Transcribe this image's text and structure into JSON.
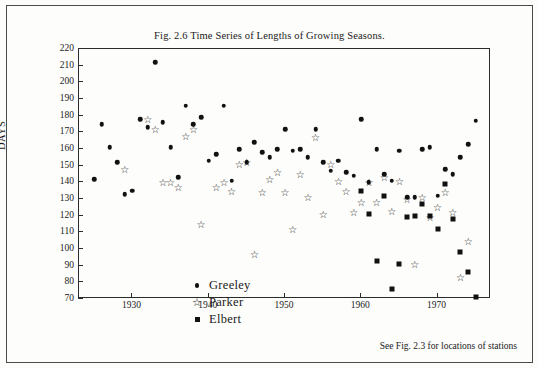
{
  "figure": {
    "title": "Fig. 2.6 Time Series of Lengths of Growing Seasons.",
    "note": "See Fig. 2.3 for locations of stations"
  },
  "chart_data": {
    "type": "scatter",
    "title": "Fig. 2.6 Time Series of Lengths of Growing Seasons.",
    "xlabel": "",
    "ylabel": "DAYS",
    "xlim": [
      1923,
      1977
    ],
    "ylim": [
      70,
      220
    ],
    "grid": false,
    "legend_position": "inside-lower-left",
    "yticks": [
      70,
      80,
      90,
      100,
      110,
      120,
      130,
      140,
      150,
      160,
      170,
      180,
      190,
      200,
      210,
      220
    ],
    "xticks": [
      1930,
      1940,
      1950,
      1960,
      1970
    ],
    "series": [
      {
        "name": "Greeley",
        "marker": "filled-circle",
        "color": "#111111",
        "points": [
          [
            1925,
            142
          ],
          [
            1926,
            175
          ],
          [
            1927,
            161
          ],
          [
            1928,
            152
          ],
          [
            1929,
            133
          ],
          [
            1930,
            135
          ],
          [
            1931,
            178
          ],
          [
            1932,
            173
          ],
          [
            1933,
            212
          ],
          [
            1934,
            176
          ],
          [
            1935,
            161
          ],
          [
            1936,
            143
          ],
          [
            1937,
            186
          ],
          [
            1938,
            175
          ],
          [
            1939,
            179
          ],
          [
            1940,
            153
          ],
          [
            1941,
            157
          ],
          [
            1942,
            186
          ],
          [
            1943,
            141
          ],
          [
            1944,
            160
          ],
          [
            1945,
            152
          ],
          [
            1946,
            164
          ],
          [
            1947,
            158
          ],
          [
            1948,
            155
          ],
          [
            1949,
            160
          ],
          [
            1950,
            172
          ],
          [
            1951,
            159
          ],
          [
            1952,
            160
          ],
          [
            1953,
            155
          ],
          [
            1954,
            172
          ],
          [
            1955,
            152
          ],
          [
            1956,
            147
          ],
          [
            1957,
            153
          ],
          [
            1958,
            146
          ],
          [
            1959,
            144
          ],
          [
            1960,
            178
          ],
          [
            1961,
            140
          ],
          [
            1962,
            160
          ],
          [
            1963,
            145
          ],
          [
            1964,
            141
          ],
          [
            1965,
            159
          ],
          [
            1966,
            131
          ],
          [
            1967,
            131
          ],
          [
            1968,
            160
          ],
          [
            1969,
            161
          ],
          [
            1970,
            132
          ],
          [
            1971,
            148
          ],
          [
            1972,
            145
          ],
          [
            1973,
            155
          ],
          [
            1974,
            163
          ],
          [
            1975,
            177
          ]
        ]
      },
      {
        "name": "Parker",
        "marker": "open-star",
        "color": "#111111",
        "points": [
          [
            1929,
            148
          ],
          [
            1932,
            178
          ],
          [
            1933,
            172
          ],
          [
            1934,
            140
          ],
          [
            1935,
            140
          ],
          [
            1936,
            137
          ],
          [
            1937,
            168
          ],
          [
            1938,
            172
          ],
          [
            1939,
            115
          ],
          [
            1941,
            137
          ],
          [
            1942,
            140
          ],
          [
            1943,
            135
          ],
          [
            1944,
            151
          ],
          [
            1945,
            152
          ],
          [
            1946,
            97
          ],
          [
            1947,
            134
          ],
          [
            1948,
            142
          ],
          [
            1949,
            146
          ],
          [
            1950,
            134
          ],
          [
            1951,
            112
          ],
          [
            1952,
            145
          ],
          [
            1953,
            131
          ],
          [
            1954,
            167
          ],
          [
            1955,
            121
          ],
          [
            1956,
            151
          ],
          [
            1957,
            141
          ],
          [
            1958,
            135
          ],
          [
            1959,
            122
          ],
          [
            1960,
            128
          ],
          [
            1961,
            140
          ],
          [
            1962,
            128
          ],
          [
            1963,
            143
          ],
          [
            1964,
            123
          ],
          [
            1965,
            141
          ],
          [
            1966,
            130
          ],
          [
            1967,
            91
          ],
          [
            1968,
            131
          ],
          [
            1969,
            119
          ],
          [
            1970,
            125
          ],
          [
            1971,
            134
          ],
          [
            1972,
            122
          ],
          [
            1973,
            83
          ],
          [
            1974,
            105
          ]
        ]
      },
      {
        "name": "Elbert",
        "marker": "filled-square",
        "color": "#111111",
        "points": [
          [
            1960,
            135
          ],
          [
            1961,
            121
          ],
          [
            1962,
            93
          ],
          [
            1963,
            132
          ],
          [
            1964,
            76
          ],
          [
            1965,
            91
          ],
          [
            1966,
            119
          ],
          [
            1967,
            120
          ],
          [
            1968,
            127
          ],
          [
            1969,
            120
          ],
          [
            1970,
            112
          ],
          [
            1971,
            139
          ],
          [
            1972,
            118
          ],
          [
            1973,
            98
          ],
          [
            1974,
            86
          ],
          [
            1975,
            71
          ]
        ]
      }
    ]
  },
  "legend": [
    {
      "label": "Greeley",
      "symbol": "●"
    },
    {
      "label": "Parker",
      "symbol": "☆"
    },
    {
      "label": "Elbert",
      "symbol": "■"
    }
  ]
}
